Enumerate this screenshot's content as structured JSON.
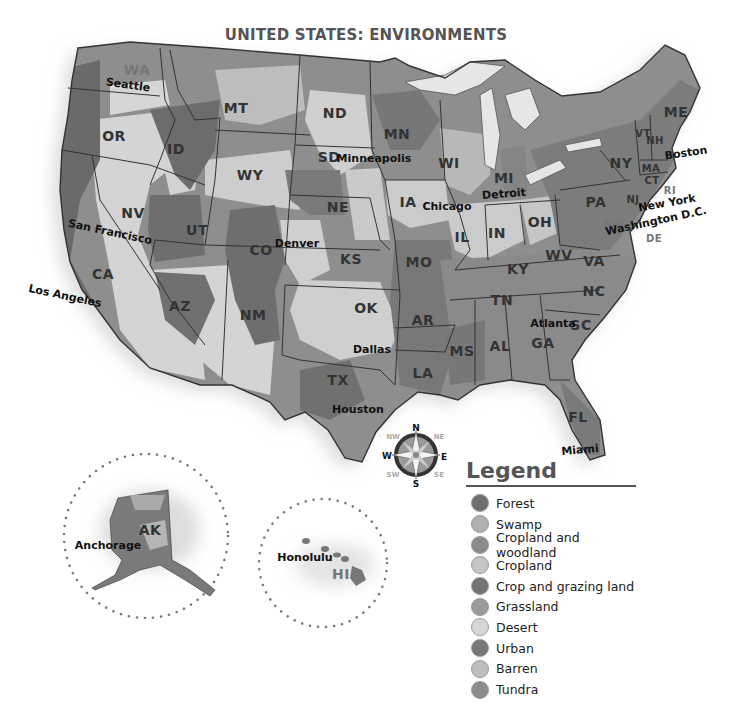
{
  "title": "UNITED STATES: ENVIRONMENTS",
  "legend": {
    "title": "Legend",
    "items": [
      {
        "label": "Forest",
        "color": "#6e6e6e"
      },
      {
        "label": "Swamp",
        "color": "#b0b0b0"
      },
      {
        "label": "Cropland and woodland",
        "color": "#8a8a8a"
      },
      {
        "label": "Cropland",
        "color": "#c6c6c6"
      },
      {
        "label": "Crop and grazing land",
        "color": "#737373"
      },
      {
        "label": "Grassland",
        "color": "#9a9a9a"
      },
      {
        "label": "Desert",
        "color": "#d6d6d6"
      },
      {
        "label": "Urban",
        "color": "#777777"
      },
      {
        "label": "Barren",
        "color": "#bebebe"
      },
      {
        "label": "Tundra",
        "color": "#8c8c8c"
      }
    ]
  },
  "states": [
    {
      "abbr": "WA",
      "x": 137,
      "y": 70,
      "light": true
    },
    {
      "abbr": "OR",
      "x": 114,
      "y": 136
    },
    {
      "abbr": "CA",
      "x": 103,
      "y": 274
    },
    {
      "abbr": "NV",
      "x": 133,
      "y": 213
    },
    {
      "abbr": "ID",
      "x": 176,
      "y": 149
    },
    {
      "abbr": "MT",
      "x": 236,
      "y": 108
    },
    {
      "abbr": "WY",
      "x": 250,
      "y": 175
    },
    {
      "abbr": "UT",
      "x": 197,
      "y": 230
    },
    {
      "abbr": "AZ",
      "x": 180,
      "y": 306
    },
    {
      "abbr": "CO",
      "x": 261,
      "y": 250
    },
    {
      "abbr": "NM",
      "x": 253,
      "y": 315
    },
    {
      "abbr": "ND",
      "x": 335,
      "y": 113
    },
    {
      "abbr": "SD",
      "x": 329,
      "y": 157
    },
    {
      "abbr": "NE",
      "x": 338,
      "y": 207
    },
    {
      "abbr": "KS",
      "x": 351,
      "y": 259
    },
    {
      "abbr": "OK",
      "x": 366,
      "y": 308
    },
    {
      "abbr": "TX",
      "x": 338,
      "y": 380
    },
    {
      "abbr": "MN",
      "x": 397,
      "y": 134
    },
    {
      "abbr": "IA",
      "x": 408,
      "y": 202
    },
    {
      "abbr": "MO",
      "x": 419,
      "y": 262
    },
    {
      "abbr": "AR",
      "x": 423,
      "y": 320
    },
    {
      "abbr": "LA",
      "x": 423,
      "y": 373
    },
    {
      "abbr": "WI",
      "x": 449,
      "y": 163
    },
    {
      "abbr": "IL",
      "x": 462,
      "y": 237
    },
    {
      "abbr": "MI",
      "x": 504,
      "y": 178
    },
    {
      "abbr": "IN",
      "x": 497,
      "y": 233
    },
    {
      "abbr": "OH",
      "x": 540,
      "y": 222
    },
    {
      "abbr": "KY",
      "x": 518,
      "y": 269
    },
    {
      "abbr": "TN",
      "x": 502,
      "y": 300
    },
    {
      "abbr": "MS",
      "x": 462,
      "y": 351
    },
    {
      "abbr": "AL",
      "x": 500,
      "y": 346
    },
    {
      "abbr": "GA",
      "x": 543,
      "y": 343
    },
    {
      "abbr": "FL",
      "x": 578,
      "y": 417
    },
    {
      "abbr": "SC",
      "x": 581,
      "y": 325
    },
    {
      "abbr": "NC",
      "x": 594,
      "y": 291
    },
    {
      "abbr": "VA",
      "x": 594,
      "y": 261
    },
    {
      "abbr": "WV",
      "x": 559,
      "y": 255
    },
    {
      "abbr": "PA",
      "x": 596,
      "y": 202
    },
    {
      "abbr": "NY",
      "x": 621,
      "y": 163
    },
    {
      "abbr": "ME",
      "x": 676,
      "y": 112
    },
    {
      "abbr": "VT",
      "x": 643,
      "y": 133
    },
    {
      "abbr": "NH",
      "x": 655,
      "y": 140
    },
    {
      "abbr": "MA",
      "x": 651,
      "y": 168
    },
    {
      "abbr": "CT",
      "x": 652,
      "y": 180
    },
    {
      "abbr": "RI",
      "x": 670,
      "y": 190,
      "light": true
    },
    {
      "abbr": "NJ",
      "x": 633,
      "y": 199
    },
    {
      "abbr": "MD",
      "x": 614,
      "y": 225,
      "light": true
    },
    {
      "abbr": "DE",
      "x": 654,
      "y": 238,
      "light": true
    },
    {
      "abbr": "AK",
      "x": 150,
      "y": 530
    },
    {
      "abbr": "HI",
      "x": 341,
      "y": 574,
      "light": true
    }
  ],
  "cities": [
    {
      "name": "Seattle",
      "x": 128,
      "y": 85,
      "rot": 8
    },
    {
      "name": "San Francisco",
      "x": 110,
      "y": 232,
      "rot": 12
    },
    {
      "name": "Los Angeles",
      "x": 65,
      "y": 296,
      "rot": 12
    },
    {
      "name": "Denver",
      "x": 297,
      "y": 243,
      "rot": 0
    },
    {
      "name": "Minneapolis",
      "x": 374,
      "y": 158,
      "rot": 0
    },
    {
      "name": "Chicago",
      "x": 447,
      "y": 206,
      "rot": 0
    },
    {
      "name": "Detroit",
      "x": 504,
      "y": 194,
      "rot": -4
    },
    {
      "name": "Dallas",
      "x": 372,
      "y": 349,
      "rot": 0
    },
    {
      "name": "Houston",
      "x": 358,
      "y": 409,
      "rot": 0
    },
    {
      "name": "Atlanta",
      "x": 553,
      "y": 323,
      "rot": 0
    },
    {
      "name": "Miami",
      "x": 580,
      "y": 450,
      "rot": -5
    },
    {
      "name": "Boston",
      "x": 686,
      "y": 153,
      "rot": -8
    },
    {
      "name": "New York",
      "x": 667,
      "y": 203,
      "rot": -10
    },
    {
      "name": "Washington D.C.",
      "x": 656,
      "y": 221,
      "rot": -12
    },
    {
      "name": "Anchorage",
      "x": 108,
      "y": 545,
      "rot": 0
    },
    {
      "name": "Honolulu",
      "x": 305,
      "y": 557,
      "rot": 0
    }
  ],
  "compass": {
    "n": "N",
    "s": "S",
    "e": "E",
    "w": "W",
    "ne": "NE",
    "nw": "NW",
    "se": "SE",
    "sw": "SW"
  }
}
